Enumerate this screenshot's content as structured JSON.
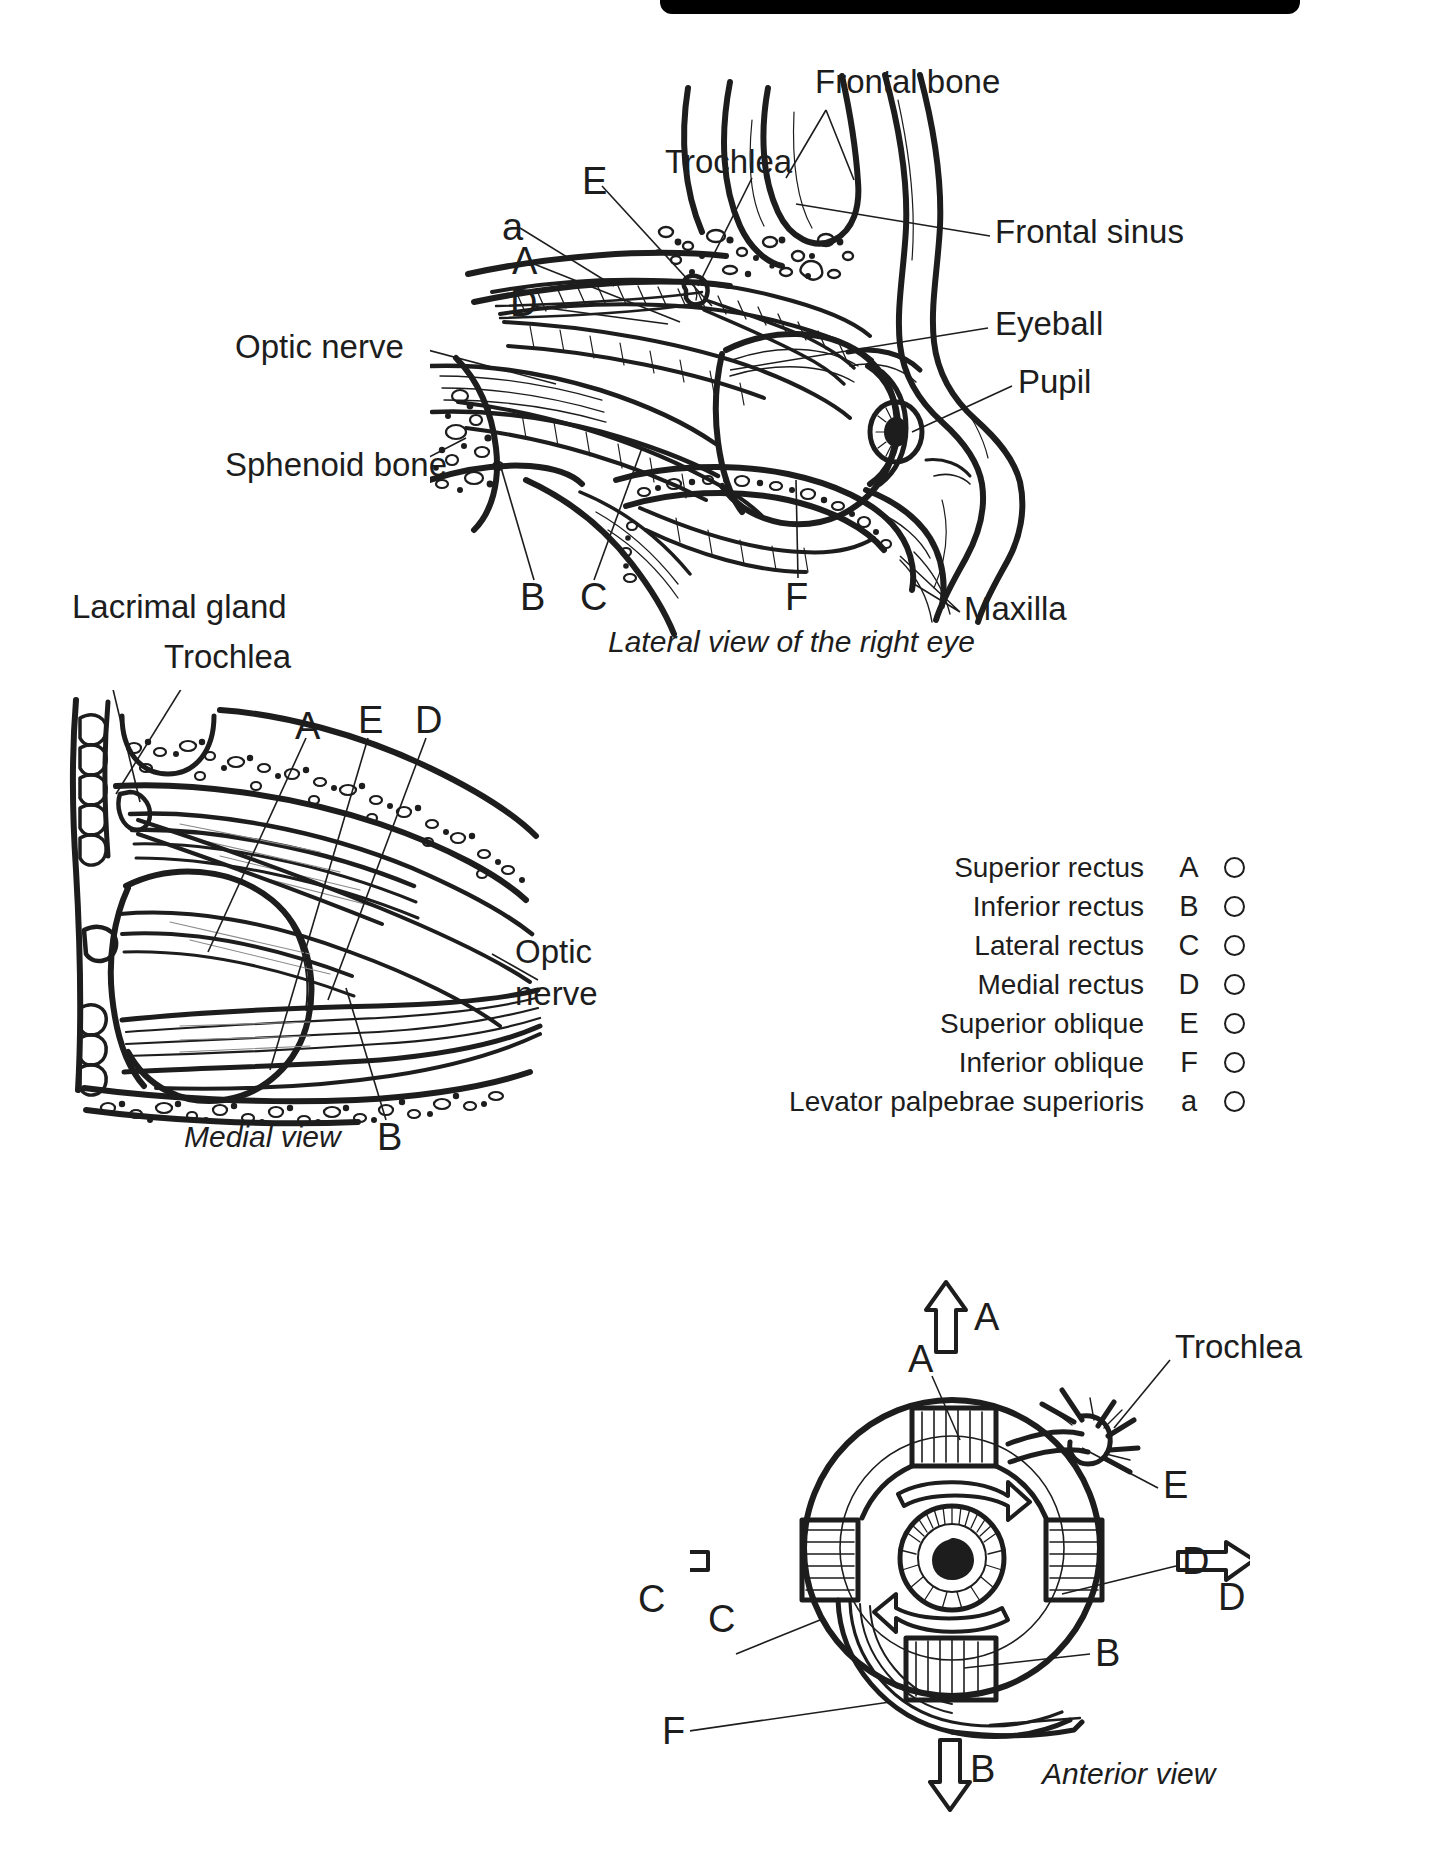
{
  "page": {
    "background": "#ffffff",
    "ink": "#1d1d1d",
    "top_bar_color": "#000000"
  },
  "figures": [
    {
      "id": "lateral",
      "caption": "Lateral view of the right eye",
      "labels": [
        {
          "text": "Frontal bone",
          "kind": "name"
        },
        {
          "text": "Trochlea",
          "kind": "name"
        },
        {
          "text": "Frontal sinus",
          "kind": "name"
        },
        {
          "text": "Eyeball",
          "kind": "name"
        },
        {
          "text": "Pupil",
          "kind": "name"
        },
        {
          "text": "Optic nerve",
          "kind": "name"
        },
        {
          "text": "Sphenoid bone",
          "kind": "name"
        },
        {
          "text": "Maxilla",
          "kind": "name"
        },
        {
          "text": "E",
          "kind": "letter"
        },
        {
          "text": "a",
          "kind": "letter"
        },
        {
          "text": "A",
          "kind": "letter"
        },
        {
          "text": "D",
          "kind": "letter"
        },
        {
          "text": "B",
          "kind": "letter"
        },
        {
          "text": "C",
          "kind": "letter"
        },
        {
          "text": "F",
          "kind": "letter"
        }
      ]
    },
    {
      "id": "medial",
      "caption": "Medial view",
      "labels": [
        {
          "text": "Lacrimal gland",
          "kind": "name"
        },
        {
          "text": "Trochlea",
          "kind": "name"
        },
        {
          "text": "Optic",
          "kind": "name"
        },
        {
          "text": "nerve",
          "kind": "name"
        },
        {
          "text": "A",
          "kind": "letter"
        },
        {
          "text": "E",
          "kind": "letter"
        },
        {
          "text": "D",
          "kind": "letter"
        },
        {
          "text": "B",
          "kind": "letter"
        }
      ]
    },
    {
      "id": "anterior",
      "caption": "Anterior view",
      "labels": [
        {
          "text": "Trochlea",
          "kind": "name"
        },
        {
          "text": "A",
          "kind": "letter"
        },
        {
          "text": "E",
          "kind": "letter"
        },
        {
          "text": "C",
          "kind": "letter"
        },
        {
          "text": "D",
          "kind": "letter"
        },
        {
          "text": "B",
          "kind": "letter"
        },
        {
          "text": "F",
          "kind": "letter"
        }
      ],
      "arrows": [
        {
          "direction": "up",
          "label": "A"
        },
        {
          "direction": "left",
          "label": "C"
        },
        {
          "direction": "right",
          "label": "D"
        },
        {
          "direction": "down",
          "label": "B"
        }
      ]
    }
  ],
  "lateral": {
    "caption": "Lateral view of the right eye",
    "frontal_bone": "Frontal bone",
    "trochlea": "Trochlea",
    "frontal_sinus": "Frontal sinus",
    "eyeball": "Eyeball",
    "pupil": "Pupil",
    "optic_nerve": "Optic nerve",
    "sphenoid_bone": "Sphenoid bone",
    "maxilla": "Maxilla",
    "letter_e": "E",
    "letter_a_lower": "a",
    "letter_a": "A",
    "letter_d": "D",
    "letter_b": "B",
    "letter_c": "C",
    "letter_f": "F"
  },
  "medial": {
    "caption": "Medial view",
    "lacrimal_gland": "Lacrimal gland",
    "trochlea": "Trochlea",
    "optic_line1": "Optic",
    "optic_line2": "nerve",
    "letter_a": "A",
    "letter_e": "E",
    "letter_d": "D",
    "letter_b": "B"
  },
  "anterior": {
    "caption": "Anterior view",
    "trochlea": "Trochlea",
    "letter_a": "A",
    "letter_a_arrow": "A",
    "letter_e": "E",
    "letter_c": "C",
    "letter_c_arrow": "C",
    "letter_d": "D",
    "letter_d_arrow": "D",
    "letter_b": "B",
    "letter_b_arrow": "B",
    "letter_f": "F"
  },
  "key": {
    "rows": [
      {
        "name": "Superior rectus",
        "letter": "A"
      },
      {
        "name": "Inferior rectus",
        "letter": "B"
      },
      {
        "name": "Lateral rectus",
        "letter": "C"
      },
      {
        "name": "Medial rectus",
        "letter": "D"
      },
      {
        "name": "Superior oblique",
        "letter": "E"
      },
      {
        "name": "Inferior oblique",
        "letter": "F"
      },
      {
        "name": "Levator palpebrae superioris",
        "letter": "a"
      }
    ]
  }
}
